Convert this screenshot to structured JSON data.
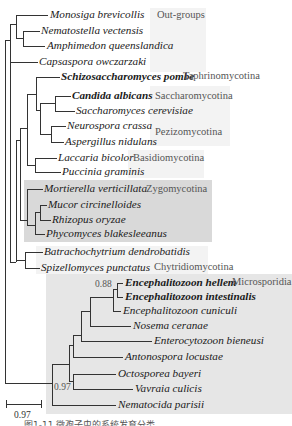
{
  "figure": {
    "type": "phylogenetic_tree",
    "caption": "图1-11 微孢子虫的系统发育分类",
    "scale_bar": {
      "label": "0.97"
    },
    "groups": [
      {
        "name": "Out-groups"
      },
      {
        "name": "Taphrinomycotina"
      },
      {
        "name": "Saccharomycotina"
      },
      {
        "name": "Pezizomycotina"
      },
      {
        "name": "Basidiomycotina"
      },
      {
        "name": "Zygomycotina"
      },
      {
        "name": "Chytridiomycotina"
      },
      {
        "name": "Microsporidia"
      }
    ],
    "support_values": [
      {
        "value": "0.88",
        "node": "Encephalitozoon hellem + Encephalitozoon intestinalis"
      },
      {
        "value": "0.97",
        "node": "Octosporea bayeri + Vavraia culicis"
      }
    ],
    "taxa": [
      {
        "name": "Monosiga brevicollis",
        "group": "Out-groups"
      },
      {
        "name": "Nematostella vectensis",
        "group": "Out-groups"
      },
      {
        "name": "Amphimedon queenslandica",
        "group": "Out-groups"
      },
      {
        "name": "Capsaspora owczarzaki",
        "group": "Out-groups"
      },
      {
        "name": "Schizosaccharomyces pombe",
        "group": "Taphrinomycotina"
      },
      {
        "name": "Candida albicans",
        "group": "Saccharomycotina"
      },
      {
        "name": "Saccharomyces cerevisiae",
        "group": "Saccharomycotina"
      },
      {
        "name": "Neurospora crassa",
        "group": "Pezizomycotina"
      },
      {
        "name": "Aspergillus nidulans",
        "group": "Pezizomycotina"
      },
      {
        "name": "Laccaria bicolor",
        "group": "Basidiomycotina"
      },
      {
        "name": "Puccinia graminis",
        "group": "Basidiomycotina"
      },
      {
        "name": "Mortierella verticillata",
        "group": "Zygomycotina"
      },
      {
        "name": "Mucor circinelloides",
        "group": "Zygomycotina"
      },
      {
        "name": "Rhizopus oryzae",
        "group": "Zygomycotina"
      },
      {
        "name": "Phycomyces blakesleeanus",
        "group": "Zygomycotina"
      },
      {
        "name": "Batrachochytrium dendrobatidis",
        "group": "Chytridiomycotina"
      },
      {
        "name": "Spizellomyces punctatus",
        "group": "Chytridiomycotina"
      },
      {
        "name": "Encephalitozoon hellem",
        "group": "Microsporidia"
      },
      {
        "name": "Encephalitozoon intestinalis",
        "group": "Microsporidia"
      },
      {
        "name": "Encephalitozoon cuniculi",
        "group": "Microsporidia"
      },
      {
        "name": "Nosema ceranae",
        "group": "Microsporidia"
      },
      {
        "name": "Enterocytozoon bieneusi",
        "group": "Microsporidia"
      },
      {
        "name": "Antonospora locustae",
        "group": "Microsporidia"
      },
      {
        "name": "Octosporea bayeri",
        "group": "Microsporidia"
      },
      {
        "name": "Vavraia culicis",
        "group": "Microsporidia"
      },
      {
        "name": "Nematocida parisii",
        "group": "Microsporidia"
      }
    ]
  }
}
